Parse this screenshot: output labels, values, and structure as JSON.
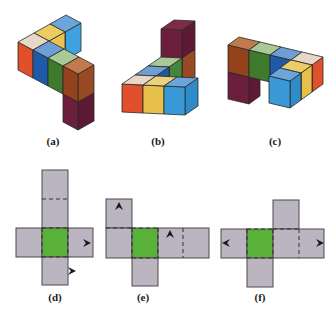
{
  "colors": {
    "net_face": "#bab5c0",
    "net_highlight": "#5ab13a",
    "net_edge": "#4a4a4a",
    "cube_edge": "#2a2a2a",
    "arrow": "#1a1a1a"
  },
  "cube_figures": [
    {
      "id": "a",
      "label": "(a)",
      "label_pos": [
        53,
        142
      ],
      "origin": [
        18,
        70
      ],
      "axes": {
        "x": [
          15,
          8
        ],
        "y": [
          16,
          -9
        ],
        "z": [
          0,
          -28
        ]
      },
      "sort": "y_desc",
      "cubes": [
        {
          "pos": [
            0,
            2,
            0
          ],
          "top": "#6aa6dc",
          "front": "#3a9ad8",
          "side": "#3fa2de"
        },
        {
          "pos": [
            0,
            1,
            0
          ],
          "top": "#ebcc62",
          "front": "#e6c04a",
          "side": "#e8c350"
        },
        {
          "pos": [
            3,
            0,
            -1
          ],
          "top": "#7e2a48",
          "front": "#6b1f3c",
          "side": "#5e1a34"
        },
        {
          "pos": [
            0,
            0,
            0
          ],
          "top": "#e8d6c6",
          "front": "#e0502a",
          "side": "#c8441f"
        },
        {
          "pos": [
            1,
            0,
            0
          ],
          "top": "#6e9fd4",
          "front": "#1f5aa8",
          "side": "#1a4d92"
        },
        {
          "pos": [
            2,
            0,
            0
          ],
          "top": "#a9c996",
          "front": "#3d7a2c",
          "side": "#356a26"
        },
        {
          "pos": [
            3,
            0,
            0
          ],
          "top": "#c27a4c",
          "front": "#93421c",
          "side": "#9a4a22"
        }
      ]
    },
    {
      "id": "b",
      "label": "(b)",
      "label_pos": [
        158,
        142
      ],
      "origin": [
        122,
        112
      ],
      "axes": {
        "x": [
          21,
          1
        ],
        "y": [
          13,
          -9
        ],
        "z": [
          0,
          -28
        ]
      },
      "sort": "y_desc",
      "cubes": [
        {
          "pos": [
            0,
            3,
            0
          ],
          "top": "#c27a4c",
          "front": "#93421c",
          "side": "#9a4a22"
        },
        {
          "pos": [
            0,
            3,
            1
          ],
          "top": "#7e2a48",
          "front": "#6b1f3c",
          "side": "#5e1a34"
        },
        {
          "pos": [
            0,
            2,
            0
          ],
          "top": "#a9c996",
          "front": "#3d7a2c",
          "side": "#46843a"
        },
        {
          "pos": [
            0,
            1,
            0
          ],
          "top": "#6e9fd4",
          "front": "#1f5aa8",
          "side": "#1f5aa8"
        },
        {
          "pos": [
            0,
            0,
            0
          ],
          "top": "#e8d6c6",
          "front": "#e0502a",
          "side": "#c8441f"
        },
        {
          "pos": [
            1,
            0,
            0
          ],
          "top": "#ecd27a",
          "front": "#e6c04a",
          "side": "#d4ae3c"
        },
        {
          "pos": [
            2,
            0,
            0
          ],
          "top": "#6ba6da",
          "front": "#3a9ad8",
          "side": "#2f8cc8"
        }
      ]
    },
    {
      "id": "c",
      "label": "(c)",
      "label_pos": [
        275,
        142
      ],
      "origin": [
        239,
        91
      ],
      "axes": {
        "x": [
          21,
          5
        ],
        "y": [
          -11,
          8
        ],
        "z": [
          0,
          -27
        ]
      },
      "sort": "y_asc",
      "cubes": [
        {
          "pos": [
            0,
            0,
            0
          ],
          "top": "#7e2a48",
          "front": "#6b1f3c",
          "side": "#5e1a34"
        },
        {
          "pos": [
            0,
            0,
            1
          ],
          "top": "#c27a4c",
          "front": "#93421c",
          "side": "#8a3c18"
        },
        {
          "pos": [
            1,
            0,
            1
          ],
          "top": "#a9c996",
          "front": "#3d7a2c",
          "side": "#356a26"
        },
        {
          "pos": [
            2,
            0,
            1
          ],
          "top": "#6e9fd4",
          "front": "#1f5aa8",
          "side": "#1a4d92"
        },
        {
          "pos": [
            3,
            0,
            1
          ],
          "top": "#e8d6c6",
          "front": "#e0502a",
          "side": "#e0502a"
        },
        {
          "pos": [
            3,
            1,
            1
          ],
          "top": "#eccc66",
          "front": "#e6c04a",
          "side": "#e6c04a"
        },
        {
          "pos": [
            3,
            2,
            1
          ],
          "top": "#6ba6da",
          "front": "#3a9ad8",
          "side": "#2f8cc8"
        }
      ]
    }
  ],
  "nets": [
    {
      "id": "d",
      "label": "(d)",
      "label_pos": [
        55,
        291
      ],
      "squares": [
        {
          "x": 42,
          "y": 170,
          "w": 26,
          "h": 58,
          "fill": "face"
        },
        {
          "x": 16,
          "y": 228,
          "w": 26,
          "h": 29,
          "fill": "face"
        },
        {
          "x": 42,
          "y": 228,
          "w": 26,
          "h": 29,
          "fill": "highlight"
        },
        {
          "x": 68,
          "y": 228,
          "w": 25,
          "h": 29,
          "fill": "face"
        },
        {
          "x": 42,
          "y": 257,
          "w": 26,
          "h": 28,
          "fill": "face"
        }
      ],
      "dashed": [
        [
          42,
          199,
          68,
          199
        ],
        [
          42,
          228,
          68,
          228
        ],
        [
          42,
          257,
          68,
          257
        ],
        [
          42,
          228,
          42,
          257
        ],
        [
          68,
          228,
          68,
          257
        ]
      ],
      "arrows": [
        {
          "x": 87,
          "y": 243,
          "dir": "right"
        },
        {
          "x": 72,
          "y": 271,
          "dir": "right"
        }
      ]
    },
    {
      "id": "e",
      "label": "(e)",
      "label_pos": [
        143,
        291
      ],
      "squares": [
        {
          "x": 106,
          "y": 199,
          "w": 26,
          "h": 29,
          "fill": "face"
        },
        {
          "x": 106,
          "y": 228,
          "w": 26,
          "h": 30,
          "fill": "face"
        },
        {
          "x": 132,
          "y": 228,
          "w": 26,
          "h": 30,
          "fill": "highlight"
        },
        {
          "x": 158,
          "y": 228,
          "w": 51,
          "h": 30,
          "fill": "face"
        },
        {
          "x": 132,
          "y": 258,
          "w": 26,
          "h": 28,
          "fill": "face"
        }
      ],
      "dashed": [
        [
          106,
          228,
          132,
          228
        ],
        [
          132,
          228,
          158,
          228
        ],
        [
          132,
          258,
          158,
          258
        ],
        [
          132,
          228,
          132,
          258
        ],
        [
          158,
          228,
          158,
          258
        ],
        [
          183,
          228,
          183,
          258
        ]
      ],
      "arrows": [
        {
          "x": 119,
          "y": 206,
          "dir": "up"
        },
        {
          "x": 170,
          "y": 234,
          "dir": "up"
        }
      ]
    },
    {
      "id": "f",
      "label": "(f)",
      "label_pos": [
        260,
        291
      ],
      "squares": [
        {
          "x": 273,
          "y": 200,
          "w": 26,
          "h": 29,
          "fill": "face"
        },
        {
          "x": 221,
          "y": 229,
          "w": 26,
          "h": 29,
          "fill": "face"
        },
        {
          "x": 247,
          "y": 229,
          "w": 26,
          "h": 29,
          "fill": "highlight"
        },
        {
          "x": 273,
          "y": 229,
          "w": 51,
          "h": 29,
          "fill": "face"
        },
        {
          "x": 247,
          "y": 258,
          "w": 26,
          "h": 29,
          "fill": "face"
        }
      ],
      "dashed": [
        [
          247,
          229,
          273,
          229
        ],
        [
          247,
          258,
          273,
          258
        ],
        [
          247,
          229,
          247,
          258
        ],
        [
          273,
          229,
          273,
          258
        ],
        [
          273,
          229,
          299,
          229
        ],
        [
          299,
          229,
          299,
          258
        ]
      ],
      "arrows": [
        {
          "x": 226,
          "y": 243,
          "dir": "left"
        },
        {
          "x": 320,
          "y": 243,
          "dir": "right"
        }
      ]
    }
  ]
}
